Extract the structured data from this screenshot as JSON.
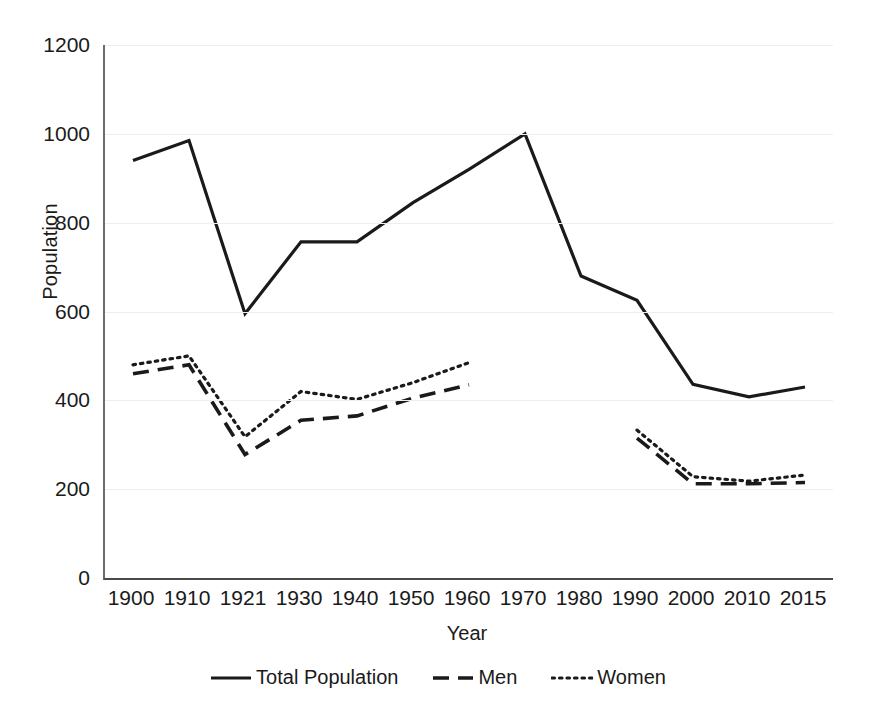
{
  "chart_data": {
    "type": "line",
    "title": "",
    "xlabel": "Year",
    "ylabel": "Population",
    "categories": [
      "1900",
      "1910",
      "1921",
      "1930",
      "1940",
      "1950",
      "1960",
      "1970",
      "1980",
      "1990",
      "2000",
      "2010",
      "2015"
    ],
    "ylim": [
      0,
      1200
    ],
    "yticks": [
      0,
      200,
      400,
      600,
      800,
      1000,
      1200
    ],
    "ytick_labels": [
      "0",
      "200",
      "400",
      "600",
      "800",
      "1000",
      "1200"
    ],
    "grid": "horizontal",
    "legend_position": "bottom-center",
    "series": [
      {
        "name": "Total Population",
        "style": "solid",
        "color": "#1a1a1a",
        "values": [
          940,
          985,
          595,
          757,
          757,
          845,
          920,
          1000,
          680,
          625,
          436,
          408,
          430
        ]
      },
      {
        "name": "Men",
        "style": "dashed",
        "color": "#1a1a1a",
        "values": [
          460,
          480,
          278,
          355,
          365,
          405,
          435,
          null,
          null,
          315,
          212,
          212,
          215
        ]
      },
      {
        "name": "Women",
        "style": "dotted",
        "color": "#1a1a1a",
        "values": [
          480,
          500,
          318,
          420,
          402,
          440,
          485,
          null,
          null,
          333,
          228,
          218,
          232
        ]
      }
    ]
  },
  "axis": {
    "ylabel": "Population",
    "xlabel": "Year"
  },
  "legend": {
    "items": [
      {
        "label": "Total Population",
        "swatch": "solid-line-swatch"
      },
      {
        "label": "Men",
        "swatch": "dashed-line-swatch"
      },
      {
        "label": "Women",
        "swatch": "dotted-line-swatch"
      }
    ]
  }
}
